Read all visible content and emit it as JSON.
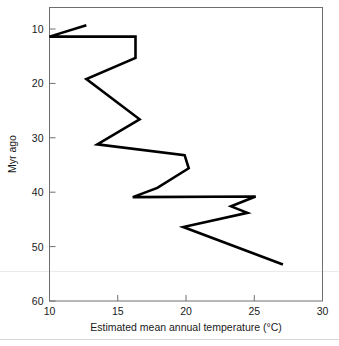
{
  "chart_data": {
    "type": "line",
    "title": "",
    "subtitle": "",
    "xlabel": "Estimated mean annual temperature (°C)",
    "ylabel": "Myr ago",
    "xlim": [
      10,
      30
    ],
    "ylim": [
      10,
      60
    ],
    "y_inverted": true,
    "grid": false,
    "legend": null,
    "xticks": [
      10,
      15,
      20,
      25,
      30
    ],
    "xticklabels": [
      "10",
      "15",
      "20",
      "25",
      "30"
    ],
    "yticks": [
      10,
      20,
      30,
      40,
      50,
      60
    ],
    "yticklabels": [
      "10",
      "20",
      "30",
      "40",
      "50",
      "60"
    ],
    "series": [
      {
        "name": "Estimated mean annual temperature",
        "color": "#000000",
        "x": [
          12.7,
          10.0,
          16.3,
          16.3,
          12.7,
          16.6,
          13.5,
          19.9,
          20.2,
          17.9,
          16.1,
          25.1,
          23.3,
          24.5,
          19.8,
          27.1
        ],
        "y": [
          9.3,
          11.4,
          11.4,
          15.3,
          19.2,
          26.6,
          31.2,
          33.2,
          35.6,
          39.2,
          40.9,
          40.8,
          42.6,
          43.8,
          46.4,
          53.3
        ]
      }
    ],
    "axis_color": "#6e6e6e",
    "line_color": "#000000"
  },
  "figure": {
    "xaxis_title": "Estimated mean annual temperature (°C)",
    "yaxis_title": "Myr ago",
    "xtick_labels": [
      "10",
      "15",
      "20",
      "25",
      "30"
    ],
    "ytick_labels": [
      "10",
      "20",
      "30",
      "40",
      "50",
      "60"
    ]
  }
}
